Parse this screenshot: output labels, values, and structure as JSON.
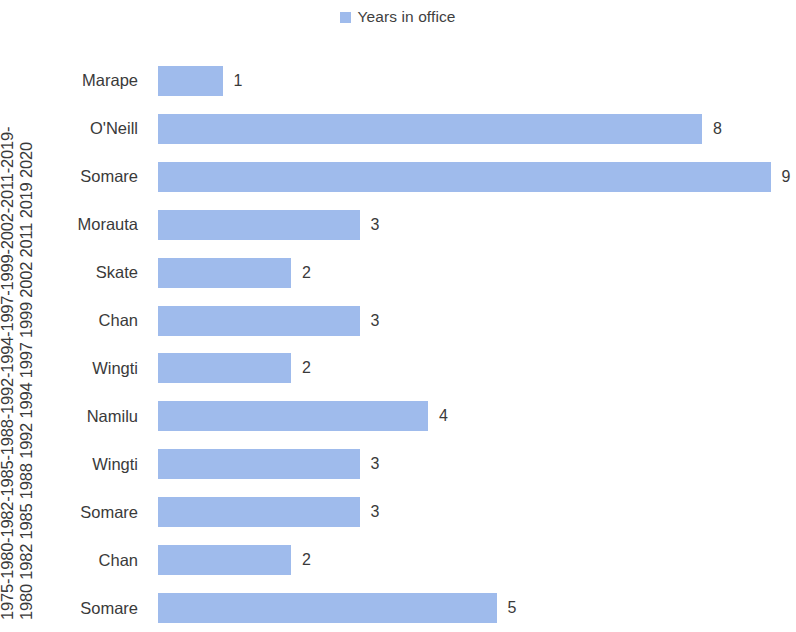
{
  "legend": {
    "position": "top-center",
    "entries": [
      {
        "label": "Years in office",
        "color": "#9fbbec",
        "swatch_name": "legend-color-swatch"
      }
    ]
  },
  "axis": {
    "category_axis_title_line1": "1975-1980-1982-1985-1988-1992-1994-1997-1999-2002-2011-2019-",
    "category_axis_title_line2": "1980 1982 1985 1988 1992 1994 1997 1999 2002 2011 2019 2020"
  },
  "chart_data": {
    "type": "bar",
    "orientation": "horizontal",
    "title": "",
    "subtitle": "",
    "xlabel": "",
    "ylabel": "1975-1980-1982-1985-1988-1992-1994-1997-1999-2002-2011-2019-1980 1982 1985 1988 1992 1994 1997 1999 2002 2011 2019 2020",
    "categories": [
      "Marape",
      "O'Neill",
      "Somare",
      "Morauta",
      "Skate",
      "Chan",
      "Wingti",
      "Namilu",
      "Wingti",
      "Somare",
      "Chan",
      "Somare"
    ],
    "values": [
      1,
      8,
      9,
      3,
      2,
      3,
      2,
      4,
      3,
      3,
      2,
      5
    ],
    "series": [
      {
        "name": "Years in office",
        "color": "#9fbbec",
        "values": [
          1,
          8,
          9,
          3,
          2,
          3,
          2,
          4,
          3,
          3,
          2,
          5
        ]
      }
    ],
    "data_labels": [
      "1",
      "8",
      "9",
      "3",
      "2",
      "3",
      "2",
      "4",
      "3",
      "3",
      "2",
      "5"
    ],
    "xlim": [
      0,
      9.2
    ],
    "grid": false,
    "legend_position": "top-center",
    "bar_color": "#9fbbec"
  },
  "colors": {
    "bar": "#9fbbec",
    "text": "#3a3a3a",
    "background": "#ffffff"
  }
}
